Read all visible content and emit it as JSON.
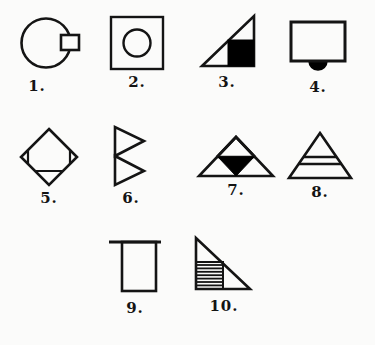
{
  "page": {
    "background_color": "#fbfbfa",
    "ink_color": "#141414",
    "fill_color": "#000000",
    "figure_count": 10
  },
  "figures": [
    {
      "number": "1.",
      "name": "circle-with-rectangle",
      "description": "Large circle with a small rectangle overlapping its right edge",
      "shapes": [
        "circle",
        "rectangle"
      ],
      "filled": false
    },
    {
      "number": "2.",
      "name": "square-with-circle",
      "description": "Square with a circle centered inside it",
      "shapes": [
        "square",
        "circle"
      ],
      "filled": false
    },
    {
      "number": "3.",
      "name": "triangle-with-black-square",
      "description": "Right triangle with right angle at bottom right containing a solid black square in its lower right",
      "shapes": [
        "right-triangle",
        "square"
      ],
      "filled": true
    },
    {
      "number": "4.",
      "name": "rectangle-with-black-semicircle",
      "description": "Rectangle with a solid black semicircle bump below its bottom edge",
      "shapes": [
        "rectangle",
        "semicircle"
      ],
      "filled": true
    },
    {
      "number": "5.",
      "name": "diamond-with-cut-corners",
      "description": "Diamond with chords cutting off the left, right and bottom vertices",
      "shapes": [
        "diamond",
        "pentagon"
      ],
      "filled": false
    },
    {
      "number": "6.",
      "name": "two-stacked-right-pointing-triangles",
      "description": "Two triangles pointing right, stacked vertically sharing a vertical left edge",
      "shapes": [
        "triangle",
        "triangle"
      ],
      "filled": false
    },
    {
      "number": "7.",
      "name": "triangle-with-black-inverted-triangle",
      "description": "Wide triangle with a horizontal midline, inner triangle and solid black downward triangle at center",
      "shapes": [
        "triangle",
        "triangle",
        "inverted-triangle"
      ],
      "filled": true
    },
    {
      "number": "8.",
      "name": "triangle-with-two-horizontal-lines",
      "description": "Triangle crossed by two horizontal lines forming three bands",
      "shapes": [
        "triangle",
        "line",
        "line"
      ],
      "filled": false
    },
    {
      "number": "9.",
      "name": "rectangle-with-overhanging-top-line",
      "description": "Tall rectangle with a horizontal line across its top extending past the left edge",
      "shapes": [
        "rectangle",
        "line"
      ],
      "filled": false
    },
    {
      "number": "10.",
      "name": "triangle-with-hatched-square",
      "description": "Right triangle with right angle at bottom left containing a horizontally hatched square",
      "shapes": [
        "right-triangle",
        "square"
      ],
      "filled": false,
      "hatch_lines": 8
    }
  ]
}
